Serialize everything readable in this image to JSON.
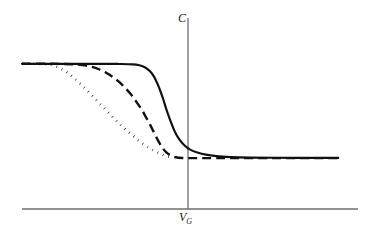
{
  "figure": {
    "title": "",
    "background_color": "#ffffff",
    "width": 378,
    "height": 238
  },
  "labels": {
    "y_axis": "C",
    "x_axis_base": "V",
    "x_axis_sub": "G",
    "x_axis_full": "V_G"
  },
  "axes": {
    "color": "#6e6e6e",
    "x_axis": {
      "y": 209,
      "x_start": 22,
      "x_end": 358,
      "stroke_width": 1.3
    },
    "y_axis": {
      "x": 188,
      "y_top": 18,
      "y_bottom": 209,
      "stroke_width": 1.3
    }
  },
  "styles": {
    "curve_color": "#111111",
    "solid_width": 2.2,
    "dashed_width": 2.4,
    "dashed_pattern": "9 5",
    "dotted_width": 2.6,
    "dotted_pattern": "0.6 5.2"
  },
  "chart_data": {
    "type": "line",
    "title": "",
    "xlabel": "V_G",
    "ylabel": "C",
    "grid": false,
    "legend": "none",
    "axis_origin_note": "Vertical axis drawn at V_G reference position; x axis at baseline",
    "xlim": [
      0,
      1
    ],
    "ylim": [
      0,
      1
    ],
    "high_plateau_y": 0.78,
    "low_plateau_y": 0.26,
    "series": [
      {
        "name": "solid",
        "line_style": "solid",
        "description": "High-frequency ideal C-V curve: stays at maximum capacitance longest, then falls most steeply past V_G and levels at minimum capacitance",
        "points": [
          [
            0.0,
            0.78
          ],
          [
            0.12,
            0.78
          ],
          [
            0.24,
            0.78
          ],
          [
            0.3,
            0.779
          ],
          [
            0.34,
            0.777
          ],
          [
            0.36,
            0.772
          ],
          [
            0.378,
            0.76
          ],
          [
            0.392,
            0.74
          ],
          [
            0.404,
            0.712
          ],
          [
            0.414,
            0.676
          ],
          [
            0.424,
            0.632
          ],
          [
            0.434,
            0.58
          ],
          [
            0.444,
            0.522
          ],
          [
            0.456,
            0.462
          ],
          [
            0.468,
            0.408
          ],
          [
            0.482,
            0.364
          ],
          [
            0.498,
            0.33
          ],
          [
            0.516,
            0.306
          ],
          [
            0.538,
            0.29
          ],
          [
            0.564,
            0.278
          ],
          [
            0.596,
            0.27
          ],
          [
            0.64,
            0.265
          ],
          [
            0.7,
            0.262
          ],
          [
            0.78,
            0.261
          ],
          [
            0.88,
            0.26
          ],
          [
            0.97,
            0.26
          ]
        ]
      },
      {
        "name": "dashed",
        "line_style": "dashed",
        "description": "Intermediate frequency C-V curve: departs plateau earlier, falls with moderate slope, reaches minimum near V_G",
        "points": [
          [
            0.0,
            0.78
          ],
          [
            0.09,
            0.78
          ],
          [
            0.15,
            0.778
          ],
          [
            0.185,
            0.773
          ],
          [
            0.212,
            0.764
          ],
          [
            0.236,
            0.75
          ],
          [
            0.258,
            0.731
          ],
          [
            0.278,
            0.708
          ],
          [
            0.298,
            0.68
          ],
          [
            0.316,
            0.648
          ],
          [
            0.334,
            0.612
          ],
          [
            0.35,
            0.572
          ],
          [
            0.366,
            0.53
          ],
          [
            0.38,
            0.486
          ],
          [
            0.394,
            0.44
          ],
          [
            0.406,
            0.396
          ],
          [
            0.418,
            0.354
          ],
          [
            0.43,
            0.318
          ],
          [
            0.442,
            0.292
          ],
          [
            0.456,
            0.274
          ],
          [
            0.472,
            0.264
          ],
          [
            0.492,
            0.26
          ],
          [
            0.52,
            0.259
          ],
          [
            0.6,
            0.259
          ],
          [
            0.7,
            0.259
          ],
          [
            0.82,
            0.259
          ],
          [
            0.97,
            0.259
          ]
        ]
      },
      {
        "name": "dotted",
        "line_style": "dotted",
        "description": "Low-frequency / quasi-static C-V curve: departs plateau earliest and falls most gradually, terminating at the minimum-capacitance level just left of V_G",
        "points": [
          [
            0.0,
            0.78
          ],
          [
            0.05,
            0.78
          ],
          [
            0.08,
            0.777
          ],
          [
            0.098,
            0.77
          ],
          [
            0.114,
            0.758
          ],
          [
            0.13,
            0.742
          ],
          [
            0.146,
            0.722
          ],
          [
            0.162,
            0.698
          ],
          [
            0.178,
            0.672
          ],
          [
            0.194,
            0.644
          ],
          [
            0.21,
            0.614
          ],
          [
            0.226,
            0.584
          ],
          [
            0.242,
            0.554
          ],
          [
            0.258,
            0.524
          ],
          [
            0.274,
            0.494
          ],
          [
            0.29,
            0.464
          ],
          [
            0.306,
            0.436
          ],
          [
            0.322,
            0.41
          ],
          [
            0.338,
            0.386
          ],
          [
            0.354,
            0.362
          ],
          [
            0.37,
            0.34
          ],
          [
            0.386,
            0.32
          ],
          [
            0.402,
            0.302
          ],
          [
            0.418,
            0.288
          ],
          [
            0.434,
            0.276
          ],
          [
            0.448,
            0.268
          ],
          [
            0.46,
            0.263
          ]
        ]
      }
    ]
  }
}
